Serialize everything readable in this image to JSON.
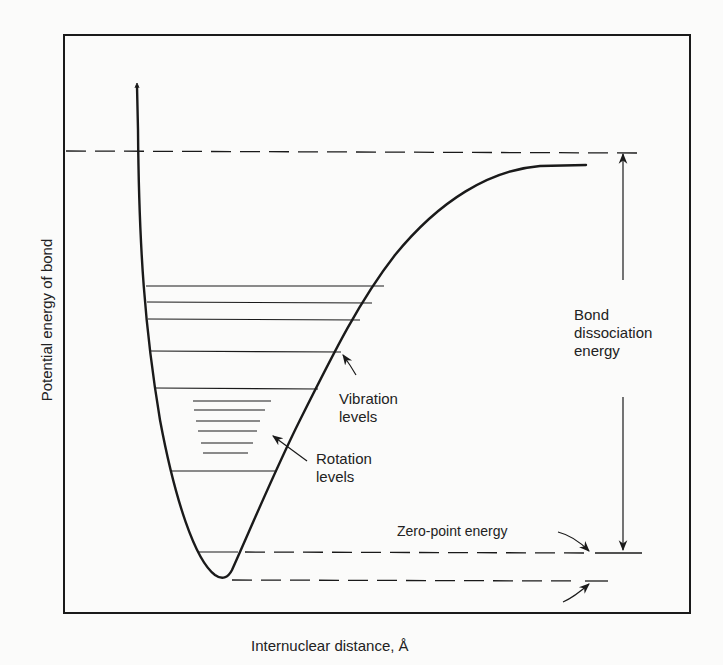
{
  "diagram": {
    "type": "potential-energy-curve",
    "y_axis_label": "Potential energy of bond",
    "x_axis_label": "Internuclear distance, Å",
    "annotations": {
      "bond_dissociation": "Bond dissociation energy",
      "bond_line1": "Bond",
      "bond_line2": "dissociation",
      "bond_line3": "energy",
      "vibration_line1": "Vibration",
      "vibration_line2": "levels",
      "rotation_line1": "Rotation",
      "rotation_line2": "levels",
      "zero_point": "Zero-point energy"
    },
    "vibration_levels_count": 7,
    "rotation_levels_count": 6,
    "colors": {
      "ink": "#1a1a1a",
      "paper": "#fbfbfa"
    }
  }
}
